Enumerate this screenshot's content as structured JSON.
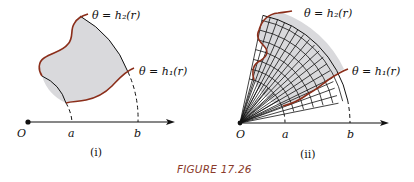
{
  "figure": {
    "caption": "FIGURE 17.26",
    "colors": {
      "curve": "#8b2e1a",
      "shade": "#d9d9dc",
      "ink": "#111111",
      "caption": "#8a3a2a"
    },
    "panels": [
      {
        "id": "i",
        "label": "(i)",
        "origin_label": "O",
        "a_label": "a",
        "b_label": "b",
        "upper_curve_label": "θ = h₂(r)",
        "lower_curve_label": "θ = h₁(r)"
      },
      {
        "id": "ii",
        "label": "(ii)",
        "origin_label": "O",
        "a_label": "a",
        "b_label": "b",
        "upper_curve_label": "θ = h₂(r)",
        "lower_curve_label": "θ = h₁(r)"
      }
    ]
  }
}
